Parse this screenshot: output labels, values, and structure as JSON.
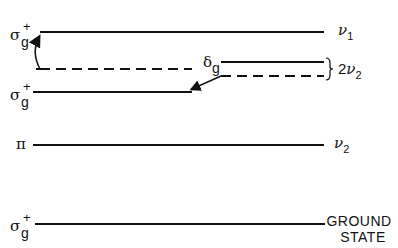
{
  "diagram": {
    "type": "energy-level-diagram",
    "levels": [
      {
        "id": "sigma_upper",
        "symbol": "σ",
        "superscript": "+",
        "subscript": "g",
        "right_label": "ν",
        "right_sub": "1",
        "style": "solid"
      },
      {
        "id": "sigma_mid_dashed",
        "style": "dashed"
      },
      {
        "id": "delta_g_upper",
        "symbol": "δ",
        "subscript": "g",
        "style": "solid"
      },
      {
        "id": "delta_g_lower",
        "style": "dashed"
      },
      {
        "id": "sigma_lower",
        "symbol": "σ",
        "superscript": "+",
        "subscript": "g",
        "style": "solid"
      },
      {
        "id": "pi",
        "symbol": "π",
        "right_label": "ν",
        "right_sub": "2",
        "style": "solid"
      },
      {
        "id": "ground",
        "symbol": "σ",
        "superscript": "+",
        "subscript": "g",
        "right_label_line1": "GROUND",
        "right_label_line2": "STATE",
        "style": "solid"
      }
    ],
    "brace_label": {
      "prefix": "2",
      "symbol": "ν",
      "sub": "2"
    },
    "arrows": [
      {
        "from": "sigma_mid_dashed",
        "to": "sigma_upper",
        "shape": "curved"
      },
      {
        "from": "delta_g_lower",
        "to": "sigma_lower",
        "shape": "straight"
      }
    ],
    "colors": {
      "line": "#111111",
      "background": "#ffffff"
    }
  }
}
